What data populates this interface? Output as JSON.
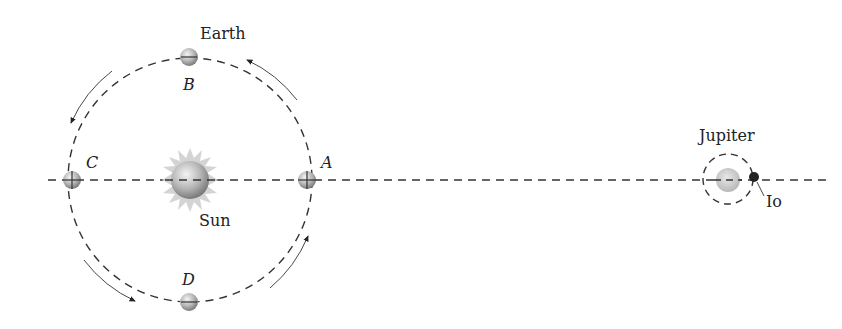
{
  "labels": {
    "earth": "Earth",
    "sun": "Sun",
    "jupiter": "Jupiter",
    "io": "Io",
    "a": "A",
    "b": "B",
    "c": "C",
    "d": "D"
  },
  "colors": {
    "line": "#333333",
    "sphere": "#b8b8b8",
    "io": "#222222",
    "sun_corona": "#d0d0d0"
  }
}
